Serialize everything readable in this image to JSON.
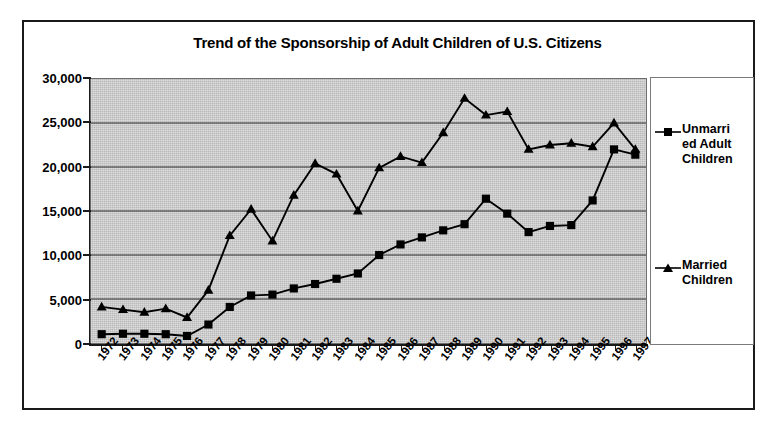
{
  "chart_data": {
    "type": "line",
    "title": "Trend of the Sponsorship of Adult Children of U.S. Citizens",
    "xlabel": "",
    "ylabel": "",
    "ylim": [
      0,
      30000
    ],
    "yticks": [
      "0",
      "5,000",
      "10,000",
      "15,000",
      "20,000",
      "25,000",
      "30,000"
    ],
    "ytick_values": [
      0,
      5000,
      10000,
      15000,
      20000,
      25000,
      30000
    ],
    "grid": true,
    "legend_position": "right",
    "categories": [
      "1972",
      "1973",
      "1974",
      "1975",
      "1976",
      "1977",
      "1978",
      "1979",
      "1980",
      "1981",
      "1982",
      "1983",
      "1984",
      "1985",
      "1986",
      "1987",
      "1988",
      "1989",
      "1990",
      "1991",
      "1992",
      "1993",
      "1994",
      "1995",
      "1996",
      "1997"
    ],
    "series": [
      {
        "name": "Unmarried Adult Children",
        "marker": "square",
        "color": "#000000",
        "values": [
          1000,
          1050,
          1050,
          1000,
          800,
          2100,
          4100,
          5400,
          5500,
          6200,
          6700,
          7300,
          7900,
          10000,
          11200,
          12000,
          12800,
          13500,
          16400,
          14700,
          12600,
          13300,
          13400,
          16200,
          22000,
          21400
        ]
      },
      {
        "name": "Married Children",
        "marker": "triangle",
        "color": "#000000",
        "values": [
          4100,
          3800,
          3500,
          3900,
          2900,
          6000,
          12200,
          15200,
          11600,
          16800,
          20400,
          19200,
          15000,
          19900,
          21200,
          20500,
          23900,
          27800,
          25900,
          26300,
          22000,
          22500,
          22700,
          22300,
          25000,
          22000
        ]
      }
    ]
  },
  "legend": {
    "entries": [
      {
        "label_lines": "Unmarri ed Adult Children",
        "line1": "Unmarri",
        "line2": "ed Adult",
        "line3": "Children"
      },
      {
        "label_lines": "Married Children",
        "line1": "Married",
        "line2": "Children",
        "line3": ""
      }
    ]
  }
}
